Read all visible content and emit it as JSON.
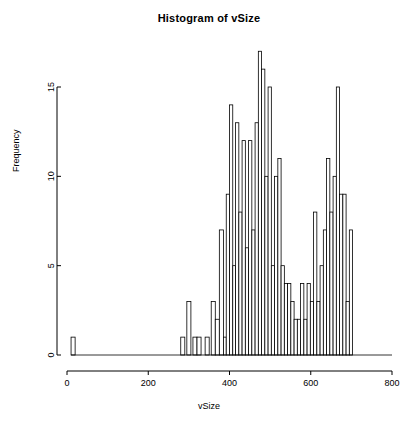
{
  "chart_data": {
    "type": "bar",
    "title": "Histogram of vSize",
    "xlabel": "vSize",
    "ylabel": "Frequency",
    "grid": false,
    "legend": false,
    "xlim": [
      0,
      800
    ],
    "ylim": [
      0,
      17
    ],
    "xticks": [
      0,
      200,
      400,
      600,
      800
    ],
    "xtick_labels": [
      "0",
      "200",
      "400",
      "600",
      "800"
    ],
    "yticks": [
      0,
      5,
      10,
      15
    ],
    "ytick_labels": [
      "0",
      "5",
      "10",
      "15"
    ],
    "bin_width": 10,
    "bin_starts": [
      10,
      280,
      290,
      300,
      310,
      320,
      330,
      340,
      350,
      360,
      370,
      380,
      390,
      400,
      410,
      420,
      430,
      440,
      450,
      460,
      470,
      480,
      490,
      500,
      510,
      520,
      530,
      540,
      550,
      560,
      570,
      580,
      590,
      600,
      610,
      620,
      630,
      640,
      650,
      660,
      670,
      680,
      690,
      700,
      710,
      720,
      730,
      740,
      750,
      760,
      770,
      780,
      790
    ],
    "bin_counts": [
      1,
      1,
      3,
      1,
      1,
      0,
      1,
      3,
      2,
      1,
      7,
      9,
      14,
      5,
      13,
      8,
      12,
      6,
      12,
      7,
      13,
      17,
      16,
      10,
      15,
      5,
      10,
      11,
      5,
      4,
      4,
      3,
      2,
      2,
      4,
      2,
      4,
      3,
      8,
      3,
      5,
      7,
      11,
      8,
      10,
      15,
      9,
      9,
      3,
      7
    ],
    "bars": [
      {
        "x0": 10,
        "x1": 20,
        "count": 1
      },
      {
        "x0": 280,
        "x1": 290,
        "count": 1
      },
      {
        "x0": 295,
        "x1": 305,
        "count": 3
      },
      {
        "x0": 310,
        "x1": 320,
        "count": 1
      },
      {
        "x0": 320,
        "x1": 330,
        "count": 1
      },
      {
        "x0": 340,
        "x1": 350,
        "count": 1
      },
      {
        "x0": 355,
        "x1": 365,
        "count": 3
      },
      {
        "x0": 365,
        "x1": 375,
        "count": 2
      },
      {
        "x0": 375,
        "x1": 385,
        "count": 7
      },
      {
        "x0": 385,
        "x1": 392,
        "count": 1
      },
      {
        "x0": 392,
        "x1": 400,
        "count": 9
      },
      {
        "x0": 400,
        "x1": 408,
        "count": 14
      },
      {
        "x0": 408,
        "x1": 415,
        "count": 5
      },
      {
        "x0": 415,
        "x1": 423,
        "count": 13
      },
      {
        "x0": 423,
        "x1": 431,
        "count": 8
      },
      {
        "x0": 431,
        "x1": 439,
        "count": 12
      },
      {
        "x0": 439,
        "x1": 447,
        "count": 6
      },
      {
        "x0": 447,
        "x1": 455,
        "count": 12
      },
      {
        "x0": 455,
        "x1": 463,
        "count": 7
      },
      {
        "x0": 463,
        "x1": 471,
        "count": 13
      },
      {
        "x0": 471,
        "x1": 479,
        "count": 17
      },
      {
        "x0": 479,
        "x1": 487,
        "count": 16
      },
      {
        "x0": 487,
        "x1": 495,
        "count": 10
      },
      {
        "x0": 495,
        "x1": 503,
        "count": 15
      },
      {
        "x0": 503,
        "x1": 511,
        "count": 5
      },
      {
        "x0": 511,
        "x1": 519,
        "count": 10
      },
      {
        "x0": 519,
        "x1": 527,
        "count": 11
      },
      {
        "x0": 527,
        "x1": 535,
        "count": 5
      },
      {
        "x0": 535,
        "x1": 543,
        "count": 4
      },
      {
        "x0": 543,
        "x1": 551,
        "count": 4
      },
      {
        "x0": 551,
        "x1": 559,
        "count": 3
      },
      {
        "x0": 559,
        "x1": 567,
        "count": 2
      },
      {
        "x0": 567,
        "x1": 575,
        "count": 2
      },
      {
        "x0": 575,
        "x1": 583,
        "count": 4
      },
      {
        "x0": 583,
        "x1": 591,
        "count": 2
      },
      {
        "x0": 591,
        "x1": 599,
        "count": 4
      },
      {
        "x0": 599,
        "x1": 607,
        "count": 3
      },
      {
        "x0": 607,
        "x1": 615,
        "count": 8
      },
      {
        "x0": 615,
        "x1": 623,
        "count": 3
      },
      {
        "x0": 623,
        "x1": 631,
        "count": 5
      },
      {
        "x0": 631,
        "x1": 639,
        "count": 7
      },
      {
        "x0": 639,
        "x1": 647,
        "count": 11
      },
      {
        "x0": 647,
        "x1": 655,
        "count": 8
      },
      {
        "x0": 655,
        "x1": 663,
        "count": 10
      },
      {
        "x0": 663,
        "x1": 671,
        "count": 15
      },
      {
        "x0": 671,
        "x1": 679,
        "count": 9
      },
      {
        "x0": 679,
        "x1": 687,
        "count": 9
      },
      {
        "x0": 687,
        "x1": 695,
        "count": 3
      },
      {
        "x0": 695,
        "x1": 703,
        "count": 7
      }
    ],
    "bar_fill": "#ffffff",
    "bar_stroke": "#000000",
    "axis_color": "#000000",
    "background": "#ffffff"
  }
}
